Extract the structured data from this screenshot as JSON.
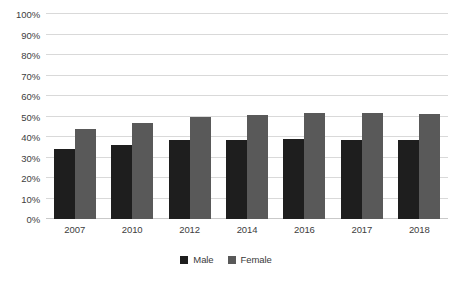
{
  "chart_data": {
    "type": "bar",
    "title": "",
    "xlabel": "",
    "ylabel": "",
    "categories": [
      "2007",
      "2010",
      "2012",
      "2014",
      "2016",
      "2017",
      "2018"
    ],
    "series": [
      {
        "name": "Male",
        "color": "#1e1e1e",
        "values": [
          34,
          36,
          38.5,
          38.5,
          39,
          38.5,
          38.5
        ]
      },
      {
        "name": "Female",
        "color": "#595959",
        "values": [
          44,
          47,
          50,
          50.5,
          51.5,
          51.5,
          51
        ]
      }
    ],
    "ylim": [
      0,
      100
    ],
    "y_ticks": [
      "0%",
      "10%",
      "20%",
      "30%",
      "40%",
      "50%",
      "60%",
      "70%",
      "80%",
      "90%",
      "100%"
    ],
    "y_tick_values": [
      0,
      10,
      20,
      30,
      40,
      50,
      60,
      70,
      80,
      90,
      100
    ],
    "grid": true,
    "legend_position": "bottom",
    "value_suffix": "%"
  },
  "legend": {
    "items": [
      {
        "label": "Male",
        "color": "#1e1e1e"
      },
      {
        "label": "Female",
        "color": "#595959"
      }
    ]
  },
  "colors": {
    "background": "#ffffff",
    "gridline": "#d9d9d9",
    "baseline": "#c9c9c9",
    "tick_text": "#404040",
    "legend_text": "#3a3a3a"
  }
}
